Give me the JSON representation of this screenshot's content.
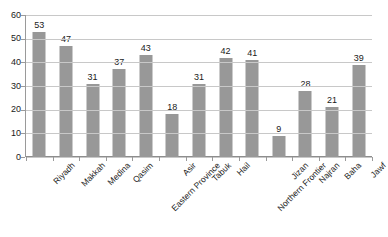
{
  "chart_data": {
    "type": "bar",
    "title": "",
    "subtitle": "",
    "xlabel": "",
    "ylabel": "",
    "ylim": [
      0,
      60
    ],
    "yticks": [
      0,
      10,
      20,
      30,
      40,
      50,
      60
    ],
    "grid": true,
    "legend": false,
    "legend_position": "none",
    "bar_color": "#989898",
    "gridline_color": "#c8c8c8",
    "axis_color": "#8d8d8d",
    "categories": [
      "Riyadh",
      "Makkah",
      "Medina",
      "Qasim",
      "Eastern Province",
      "Asir",
      "Tabuk",
      "Hail",
      "Northern Frontier",
      "Jizan",
      "Najran",
      "Baha",
      "Jawf"
    ],
    "values": [
      53,
      47,
      31,
      37,
      43,
      18,
      31,
      42,
      41,
      9,
      28,
      21,
      39
    ],
    "value_labels": [
      "53",
      "47",
      "31",
      "37",
      "43",
      "18",
      "31",
      "42",
      "41",
      "9",
      "28",
      "21",
      "39"
    ],
    "ytick_labels": [
      "0",
      "10",
      "20",
      "30",
      "40",
      "50",
      "60"
    ]
  }
}
